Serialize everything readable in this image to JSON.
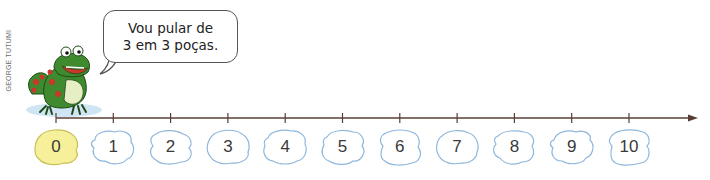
{
  "credit": "GEORGE TUTUMI",
  "speech_bubble": {
    "line1": "Vou pular de",
    "line2": "3 em 3 poças."
  },
  "number_line": {
    "start": 0,
    "end": 10,
    "step": 1,
    "axis_color": "#5a3e36",
    "puddles": [
      {
        "label": "0",
        "highlighted": true
      },
      {
        "label": "1",
        "highlighted": false
      },
      {
        "label": "2",
        "highlighted": false
      },
      {
        "label": "3",
        "highlighted": false
      },
      {
        "label": "4",
        "highlighted": false
      },
      {
        "label": "5",
        "highlighted": false
      },
      {
        "label": "6",
        "highlighted": false
      },
      {
        "label": "7",
        "highlighted": false
      },
      {
        "label": "8",
        "highlighted": false
      },
      {
        "label": "9",
        "highlighted": false
      },
      {
        "label": "10",
        "highlighted": false
      }
    ]
  },
  "colors": {
    "highlight_fill": "#f7f09a",
    "highlight_stroke": "#c9bf57",
    "puddle_fill": "#ffffff",
    "puddle_stroke": "#8fb7dc",
    "frog_green": "#3f8a2e",
    "frog_spots": "#c9382b",
    "frog_belly": "#e6efc4",
    "lily_pad": "#cfe5f3"
  }
}
